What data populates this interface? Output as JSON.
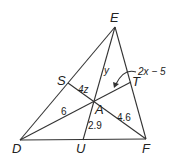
{
  "diagram": {
    "type": "triangle with medians / cevians",
    "vertices": {
      "D": "D",
      "E": "E",
      "F": "F"
    },
    "points": {
      "S": "S",
      "T": "T",
      "U": "U",
      "A": "A"
    },
    "segment_labels": {
      "SA": "4z",
      "DA": "6",
      "EA": "y",
      "AU": "2.9",
      "AF": "4.6",
      "AT": "2x − 5"
    }
  }
}
